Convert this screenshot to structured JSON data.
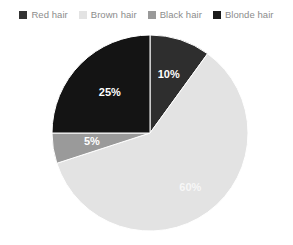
{
  "legend": {
    "position": "top",
    "items": [
      {
        "label": "Red hair",
        "color": "#333333",
        "swatch_icon": "square-swatch-icon"
      },
      {
        "label": "Brown hair",
        "color": "#e3e3e3",
        "swatch_icon": "square-swatch-icon"
      },
      {
        "label": "Black hair",
        "color": "#999999",
        "swatch_icon": "square-swatch-icon"
      },
      {
        "label": "Blonde hair",
        "color": "#1a1a1a",
        "swatch_icon": "square-swatch-icon"
      }
    ]
  },
  "labels": {
    "slice_0": "10%",
    "slice_1": "60%",
    "slice_2": "5%",
    "slice_3": "25%"
  },
  "chart_data": {
    "type": "pie",
    "title": "",
    "categories": [
      "Red hair",
      "Brown hair",
      "Black hair",
      "Blonde hair"
    ],
    "values": [
      10,
      60,
      5,
      25
    ],
    "value_labels": [
      "10%",
      "60%",
      "5%",
      "25%"
    ],
    "colors": [
      "#2e2e2e",
      "#e3e3e3",
      "#9a9a9a",
      "#141414"
    ],
    "legend_colors": [
      "#333333",
      "#e3e3e3",
      "#999999",
      "#1a1a1a"
    ],
    "units": "percent",
    "total": 100,
    "start_angle_deg": 0,
    "direction": "clockwise",
    "legend": "top",
    "grid": false,
    "xlabel": "",
    "ylabel": ""
  },
  "geometry": {
    "center_x": 150,
    "center_y": 107,
    "radius": 98
  }
}
